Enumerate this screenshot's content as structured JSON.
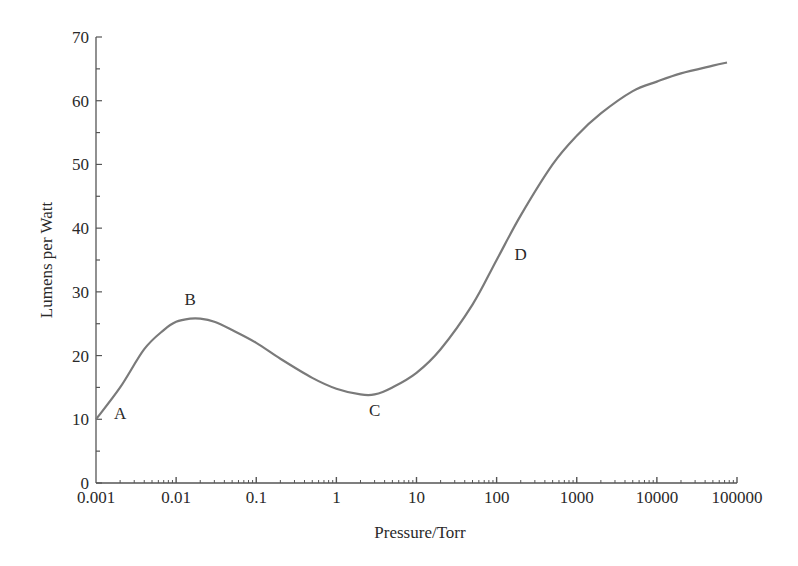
{
  "chart_data": {
    "type": "line",
    "title": "",
    "xlabel": "Pressure/Torr",
    "ylabel": "Lumens per Watt",
    "xscale": "log",
    "xlim": [
      0.001,
      100000
    ],
    "ylim": [
      0,
      70
    ],
    "grid": false,
    "legend": null,
    "x_ticks": [
      "0.001",
      "0.01",
      "0.1",
      "1",
      "10",
      "100",
      "1000",
      "10000",
      "100000"
    ],
    "y_ticks": [
      "0",
      "10",
      "20",
      "30",
      "40",
      "50",
      "60",
      "70"
    ],
    "series": [
      {
        "name": "Luminous efficacy",
        "color": "#7a7a7a",
        "x": [
          0.001,
          0.002,
          0.004,
          0.007,
          0.01,
          0.015,
          0.02,
          0.03,
          0.05,
          0.1,
          0.2,
          0.5,
          1,
          2,
          3,
          5,
          10,
          20,
          50,
          100,
          200,
          500,
          1000,
          2000,
          5000,
          10000,
          20000,
          50000,
          75000
        ],
        "values": [
          10,
          15,
          21,
          24,
          25.3,
          25.8,
          25.8,
          25.3,
          24,
          22,
          19.5,
          16.5,
          14.8,
          13.9,
          13.9,
          15,
          17.3,
          21,
          28,
          35,
          42,
          50,
          54.5,
          58,
          61.5,
          63,
          64.3,
          65.5,
          66
        ]
      }
    ],
    "annotations": [
      {
        "label": "A",
        "x": 0.002,
        "y": 10
      },
      {
        "label": "B",
        "x": 0.015,
        "y": 28
      },
      {
        "label": "C",
        "x": 3,
        "y": 10.5
      },
      {
        "label": "D",
        "x": 200,
        "y": 35
      }
    ]
  }
}
